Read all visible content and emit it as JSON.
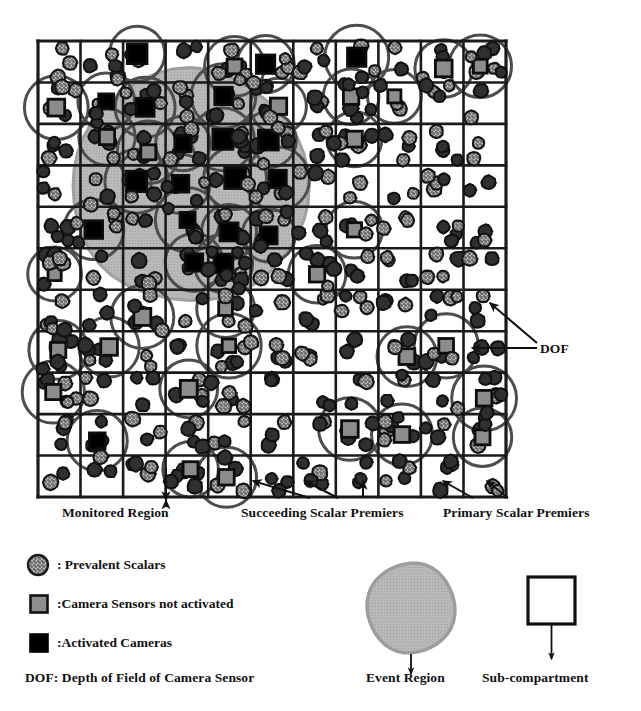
{
  "figure": {
    "grid": {
      "columns": 11,
      "rows": 11,
      "x": 38,
      "y": 41,
      "width": 468,
      "height": 456,
      "line_color": "#1a1a1a",
      "cell_label": "Sub-compartment"
    },
    "event_region": {
      "cx": 190,
      "cy": 186,
      "r": 118,
      "fill": "#b3b3b3",
      "label": "Event Region"
    },
    "dof": {
      "radius": 30,
      "stroke": "#4d4d4d",
      "label": "DOF"
    },
    "colors": {
      "prevalent_scalar": "#9a9a9a",
      "dark_scalar": "#2b2b2b",
      "camera_inactive": "#8c8c8c",
      "camera_active": "#000000",
      "event_region": "#b3b3b3",
      "dof_arc": "#4d4d4d",
      "ink": "#111111"
    }
  },
  "callouts": [
    {
      "name": "monitored-region",
      "text": "Monitored Region",
      "x": 62,
      "y": 512
    },
    {
      "name": "succeeding-scalar-premiers",
      "text": "Succeeding Scalar Premiers",
      "x": 241,
      "y": 512
    },
    {
      "name": "primary-scalar-premiers",
      "text": "Primary Scalar Premiers",
      "x": 443,
      "y": 512
    },
    {
      "name": "dof",
      "text": "DOF",
      "x": 540,
      "y": 348
    }
  ],
  "legend": {
    "items": [
      {
        "name": "prevalent-scalars",
        "symbol": "hatched-circle",
        "text": ": Prevalent Scalars"
      },
      {
        "name": "camera-sensors-not-activated",
        "symbol": "gray-square",
        "text": ":Camera Sensors not activated"
      },
      {
        "name": "activated-cameras",
        "symbol": "black-square",
        "text": ":Activated Cameras"
      }
    ],
    "dof_definition": "DOF:  Depth of Field of Camera Sensor",
    "event_region_label": "Event Region",
    "sub_compartment_label": "Sub-compartment"
  },
  "chart_data": {
    "type": "scatter",
    "xlabel": "",
    "ylabel": "",
    "xlim": [
      0,
      11
    ],
    "ylim": [
      0,
      11
    ],
    "grid": true,
    "legend_position": "bottom",
    "series": [
      {
        "name": "Prevalent Scalars",
        "marker": "hatched-circle",
        "color": "#9a9a9a",
        "count": 96
      },
      {
        "name": "Scalar Premiers",
        "marker": "dark-circle",
        "color": "#2b2b2b",
        "count": 142
      },
      {
        "name": "Camera Sensors not activated",
        "marker": "gray-square",
        "color": "#8c8c8c",
        "count": 26
      },
      {
        "name": "Activated Cameras",
        "marker": "black-square",
        "color": "#000000",
        "count": 18
      }
    ],
    "annotations": [
      "Monitored Region",
      "Succeeding Scalar Premiers",
      "Primary Scalar Premiers",
      "DOF",
      "Event Region",
      "Sub-compartment"
    ]
  }
}
